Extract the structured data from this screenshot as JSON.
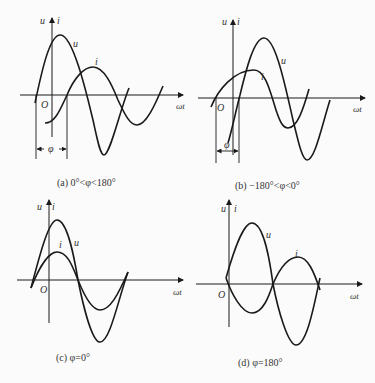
{
  "figure": {
    "panels": [
      {
        "id": "a",
        "caption": "(a) 0°<φ<180°",
        "axis_labels": {
          "y": "u",
          "y2": "i",
          "x": "ωt",
          "origin": "O"
        },
        "curve_labels": {
          "u": "u",
          "i": "i"
        },
        "phase_label": "φ",
        "description": "Voltage u leads current i by φ"
      },
      {
        "id": "b",
        "caption": "(b) −180°<φ<0°",
        "axis_labels": {
          "y": "u",
          "y2": "i",
          "x": "ωt",
          "origin": "O"
        },
        "curve_labels": {
          "u": "u",
          "i": "i"
        },
        "phase_label": "φ",
        "description": "Voltage u lags current i by |φ|"
      },
      {
        "id": "c",
        "caption": "(c) φ=0°",
        "axis_labels": {
          "y": "u",
          "y2": "i",
          "x": "ωt",
          "origin": "O"
        },
        "curve_labels": {
          "u": "u",
          "i": "i"
        },
        "description": "u and i in phase"
      },
      {
        "id": "d",
        "caption": "(d) φ=180°",
        "axis_labels": {
          "y": "u",
          "y2": "i",
          "x": "ωt",
          "origin": "O"
        },
        "curve_labels": {
          "u": "u",
          "i": "i"
        },
        "description": "u and i in opposite phase"
      }
    ]
  },
  "colors": {
    "stroke": "#1a1a1a",
    "background": "#fbfbfb"
  }
}
